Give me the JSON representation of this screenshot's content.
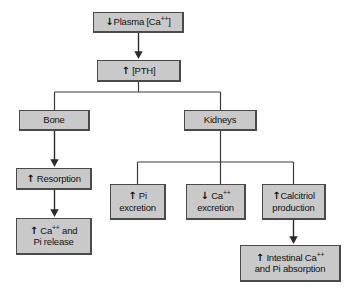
{
  "diagram": {
    "type": "flowchart",
    "box_fill": "#c9c9c9",
    "box_border": "#4a4a4a",
    "line_color": "#333333",
    "background": "#ffffff",
    "nodes": [
      {
        "id": "plasma-ca",
        "name": "plasma-calcium-box",
        "text": "Plasma [Ca++]",
        "arrow": "down",
        "arrow_glyph": "↓",
        "label_html": "Plasma [Ca<sup>++</sup>]",
        "x": 93,
        "y": 12,
        "w": 91,
        "h": 21
      },
      {
        "id": "pth",
        "name": "pth-box",
        "text": "[PTH]",
        "arrow": "up",
        "arrow_glyph": "↑",
        "label_html": "[PTH]",
        "x": 97,
        "y": 60,
        "w": 84,
        "h": 22
      },
      {
        "id": "bone",
        "name": "bone-box",
        "text": "Bone",
        "arrow": "none",
        "arrow_glyph": "",
        "label_html": "Bone",
        "x": 19,
        "y": 110,
        "w": 71,
        "h": 21
      },
      {
        "id": "kidneys",
        "name": "kidneys-box",
        "text": "Kidneys",
        "arrow": "none",
        "arrow_glyph": "",
        "label_html": "Kidneys",
        "x": 184,
        "y": 110,
        "w": 73,
        "h": 21
      },
      {
        "id": "resorption",
        "name": "resorption-box",
        "text": "Resorption",
        "arrow": "up",
        "arrow_glyph": "↑",
        "label_html": "Resorption",
        "x": 16,
        "y": 168,
        "w": 76,
        "h": 22
      },
      {
        "id": "ca-pi-release",
        "name": "calcium-pi-release-box",
        "text": "Ca++ and Pi release",
        "arrow": "up",
        "arrow_glyph": "↑",
        "label_html": "Ca<sup>++</sup> and<br>Pi release",
        "x": 16,
        "y": 218,
        "w": 76,
        "h": 37
      },
      {
        "id": "pi-excretion",
        "name": "pi-excretion-box",
        "text": "Pi excretion",
        "arrow": "up",
        "arrow_glyph": "↑",
        "label_html": "Pi<br>excretion",
        "x": 110,
        "y": 184,
        "w": 56,
        "h": 36
      },
      {
        "id": "ca-excretion",
        "name": "calcium-excretion-box",
        "text": "Ca++ excretion",
        "arrow": "down",
        "arrow_glyph": "↓",
        "label_html": "Ca<sup>++</sup><br>excretion",
        "x": 186,
        "y": 184,
        "w": 60,
        "h": 36
      },
      {
        "id": "calcitriol",
        "name": "calcitriol-production-box",
        "text": "Calcitriol production",
        "arrow": "up",
        "arrow_glyph": "↑",
        "label_html": "Calcitriol<br>production",
        "x": 262,
        "y": 184,
        "w": 64,
        "h": 36
      },
      {
        "id": "intestinal",
        "name": "intestinal-absorption-box",
        "text": "Intestinal Ca++ and Pi absorption",
        "arrow": "up",
        "arrow_glyph": "↑",
        "label_html": "Intestinal Ca<sup>++</sup><br>and Pi absorption",
        "x": 240,
        "y": 245,
        "w": 101,
        "h": 37
      }
    ],
    "edges": [
      {
        "name": "edge-plasma-to-pth",
        "from": "plasma-ca",
        "to": "pth",
        "arrowhead": true
      },
      {
        "name": "edge-pth-to-bone",
        "from": "pth",
        "to": "bone",
        "arrowhead": false
      },
      {
        "name": "edge-pth-to-kidneys",
        "from": "pth",
        "to": "kidneys",
        "arrowhead": false
      },
      {
        "name": "edge-bone-to-resorption",
        "from": "bone",
        "to": "resorption",
        "arrowhead": true
      },
      {
        "name": "edge-resorption-to-release",
        "from": "resorption",
        "to": "ca-pi-release",
        "arrowhead": true
      },
      {
        "name": "edge-kidneys-to-pi-excretion",
        "from": "kidneys",
        "to": "pi-excretion",
        "arrowhead": false
      },
      {
        "name": "edge-kidneys-to-ca-excretion",
        "from": "kidneys",
        "to": "ca-excretion",
        "arrowhead": false
      },
      {
        "name": "edge-kidneys-to-calcitriol",
        "from": "kidneys",
        "to": "calcitriol",
        "arrowhead": false
      },
      {
        "name": "edge-calcitriol-to-intestinal",
        "from": "calcitriol",
        "to": "intestinal",
        "arrowhead": true
      }
    ]
  }
}
